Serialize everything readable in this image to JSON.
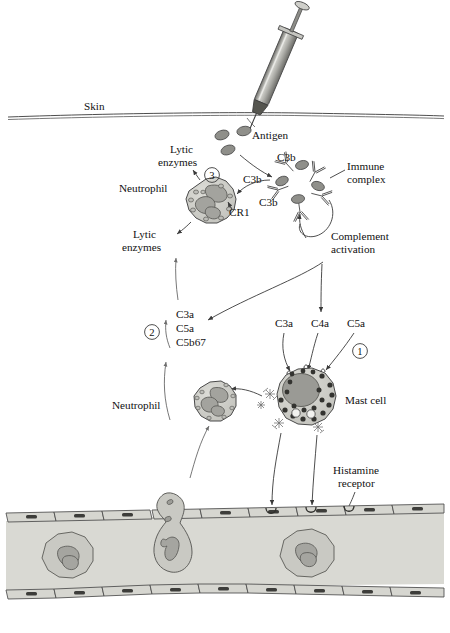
{
  "figure": {
    "background": "#ffffff"
  },
  "colors": {
    "cell_fill": "#c9c9c4",
    "cell_stroke": "#4a4a4a",
    "nucleus_fill": "#9a9a95",
    "granule_dark": "#3d3d3d",
    "vessel_fill": "#d8d8d2",
    "endothelium_fill": "#d2d2cc",
    "antigen_fill": "#8a8a85",
    "line": "#3a3a3a",
    "syringe_barrel": "#b8b8b3",
    "syringe_dark": "#5a5a56"
  },
  "labels": {
    "skin": "Skin",
    "antigen": "Antigen",
    "lytic_enzymes_top": "Lytic\nenzymes",
    "lytic_enzymes_top_l1": "Lytic",
    "lytic_enzymes_top_l2": "enzymes",
    "lytic_enzymes_bottom_l1": "Lytic",
    "lytic_enzymes_bottom_l2": "enzymes",
    "neutrophil_top": "Neutrophil",
    "neutrophil_bottom": "Neutrophil",
    "cr1": "CR1",
    "c3b_1": "C3b",
    "c3b_2": "C3b",
    "c3b_3": "C3b",
    "immune_complex_l1": "Immune",
    "immune_complex_l2": "complex",
    "complement_activation_l1": "Complement",
    "complement_activation_l2": "activation",
    "mediators_l1": "C3a",
    "mediators_l2": "C5a",
    "mediators_l3": "C5b67",
    "anaphylatoxin_c3a": "C3a",
    "anaphylatoxin_c4a": "C4a",
    "anaphylatoxin_c5a": "C5a",
    "mast_cell": "Mast cell",
    "histamine_receptor_l1": "Histamine",
    "histamine_receptor_l2": "receptor",
    "step_one": "①",
    "step_two": "②",
    "step_three": "③"
  },
  "steps": [
    {
      "id": "1",
      "glyph": "①",
      "meaning": "Anaphylatoxins C3a, C4a, C5a bind mast cell receptors and trigger degranulation"
    },
    {
      "id": "2",
      "glyph": "②",
      "meaning": "C3a, C5a, C5b67 attract neutrophils by chemotaxis"
    },
    {
      "id": "3",
      "glyph": "③",
      "meaning": "Neutrophil CR1 binds C3b on immune complexes and releases lytic enzymes"
    }
  ]
}
